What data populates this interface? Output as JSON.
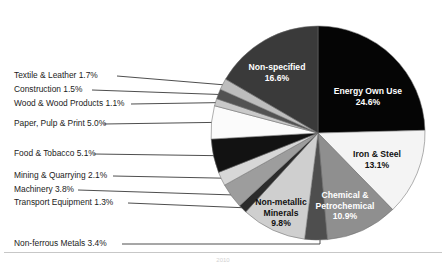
{
  "chart_data": {
    "type": "pie",
    "title": "",
    "subtitle": "",
    "xlabel": "",
    "ylabel": "",
    "legend_position": "callout-labels",
    "grid": false,
    "units": "percent",
    "total": 100.0,
    "start_angle_deg": 0,
    "direction": "clockwise",
    "categories": [
      "Energy Own Use",
      "Iron & Steel",
      "Chemical & Petrochemical",
      "Non-ferrous Metals",
      "Non-metallic Minerals",
      "Transport Equipment",
      "Machinery",
      "Mining & Quarrying",
      "Food & Tobacco",
      "Paper, Pulp & Print",
      "Wood & Wood Products",
      "Construction",
      "Textile & Leather",
      "Non-specified"
    ],
    "values": [
      24.6,
      13.1,
      10.9,
      3.4,
      9.8,
      1.3,
      3.8,
      2.1,
      5.1,
      5.0,
      1.1,
      1.5,
      1.7,
      16.6
    ],
    "colors": [
      "#050505",
      "#f4f4f4",
      "#8f8f8f",
      "#4e4e4e",
      "#cfcfcf",
      "#2b2b2b",
      "#9d9d9d",
      "#d7d7d7",
      "#121212",
      "#fbfbfb",
      "#c9c9c9",
      "#525252",
      "#bdbdbd",
      "#3a3a3a"
    ],
    "label_placement": [
      "inside",
      "inside",
      "inside",
      "callout",
      "inside",
      "callout",
      "callout",
      "callout",
      "callout",
      "callout",
      "callout",
      "callout",
      "callout",
      "inside"
    ]
  },
  "inside_labels": [
    {
      "name": "Non-specified",
      "line1": "Non-specified",
      "line2": "16.6%",
      "tone": "light"
    },
    {
      "name": "Energy Own Use",
      "line1": "Energy Own Use",
      "line2": "24.6%",
      "tone": "light"
    },
    {
      "name": "Iron & Steel",
      "line1": "Iron & Steel",
      "line2": "13.1%",
      "tone": "dark"
    },
    {
      "name": "Chemical & Petrochemical",
      "line1": "Chemical &",
      "line2": "Petrochemical",
      "line3": "10.9%",
      "tone": "light"
    },
    {
      "name": "Non-metallic Minerals",
      "line1": "Non-metallic",
      "line2": "Minerals",
      "line3": "9.8%",
      "tone": "dark"
    }
  ],
  "callouts": [
    {
      "name": "Textile & Leather",
      "text": "Textile & Leather 1.7%"
    },
    {
      "name": "Construction",
      "text": "Construction 1.5%"
    },
    {
      "name": "Wood & Wood Products",
      "text": "Wood & Wood Products 1.1%"
    },
    {
      "name": "Paper, Pulp & Print",
      "text": "Paper, Pulp & Print 5.0%"
    },
    {
      "name": "Food & Tobacco",
      "text": "Food & Tobacco 5.1%"
    },
    {
      "name": "Mining & Quarrying",
      "text": "Mining & Quarrying 2.1%"
    },
    {
      "name": "Machinery",
      "text": "Machinery 3.8%"
    },
    {
      "name": "Transport Equipment",
      "text": "Transport Equipment 1.3%"
    },
    {
      "name": "Non-ferrous Metals",
      "text": "Non-ferrous Metals 3.4%"
    }
  ],
  "caption": {
    "text": "2010"
  },
  "figure": {
    "background": "#ffffff",
    "outline": "#6e6e6e"
  }
}
